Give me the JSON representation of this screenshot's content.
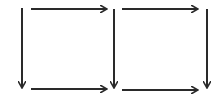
{
  "diagram": {
    "title": "",
    "stroke_color": "#2a2a2a",
    "background": "#ffffff",
    "arrows": [
      {
        "id": "top-left",
        "direction": "right",
        "x1": 31,
        "y1": 9,
        "x2": 107,
        "y2": 9
      },
      {
        "id": "top-right",
        "direction": "right",
        "x1": 122,
        "y1": 9,
        "x2": 198,
        "y2": 9
      },
      {
        "id": "left-vertical",
        "direction": "down",
        "x1": 22,
        "y1": 8,
        "x2": 22,
        "y2": 88
      },
      {
        "id": "middle-vertical",
        "direction": "down",
        "x1": 114,
        "y1": 9,
        "x2": 114,
        "y2": 88
      },
      {
        "id": "right-vertical",
        "direction": "down",
        "x1": 207,
        "y1": 9,
        "x2": 207,
        "y2": 88
      },
      {
        "id": "bottom-left",
        "direction": "right",
        "x1": 31,
        "y1": 89,
        "x2": 107,
        "y2": 89
      },
      {
        "id": "bottom-right",
        "direction": "right",
        "x1": 122,
        "y1": 90,
        "x2": 198,
        "y2": 90
      }
    ]
  }
}
